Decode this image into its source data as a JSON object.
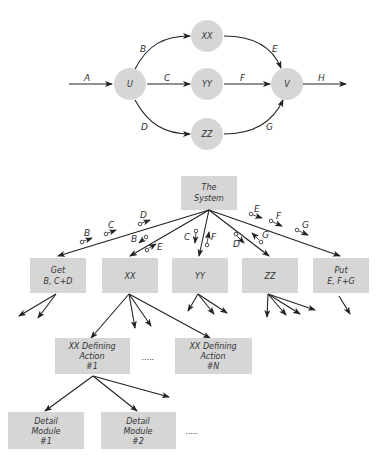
{
  "flow_diagram": {
    "nodes": [
      {
        "id": "U",
        "label": "U"
      },
      {
        "id": "XX",
        "label": "XX"
      },
      {
        "id": "YY",
        "label": "YY"
      },
      {
        "id": "ZZ",
        "label": "ZZ"
      },
      {
        "id": "V",
        "label": "V"
      }
    ],
    "edges": [
      {
        "from": "in",
        "to": "U",
        "label": "A"
      },
      {
        "from": "U",
        "to": "XX",
        "label": "B"
      },
      {
        "from": "U",
        "to": "YY",
        "label": "C"
      },
      {
        "from": "U",
        "to": "ZZ",
        "label": "D"
      },
      {
        "from": "XX",
        "to": "V",
        "label": "E"
      },
      {
        "from": "YY",
        "to": "V",
        "label": "F"
      },
      {
        "from": "ZZ",
        "to": "V",
        "label": "G"
      },
      {
        "from": "V",
        "to": "out",
        "label": "H"
      }
    ]
  },
  "structure_chart": {
    "root": {
      "line1": "The",
      "line2": "System"
    },
    "level1": [
      {
        "line1": "Get",
        "line2": "B, C+D"
      },
      {
        "line1": "XX",
        "line2": ""
      },
      {
        "line1": "YY",
        "line2": ""
      },
      {
        "line1": "ZZ",
        "line2": ""
      },
      {
        "line1": "Put",
        "line2": "E, F+G"
      }
    ],
    "couples": {
      "get": [
        "B",
        "C",
        "D"
      ],
      "xx": [
        "B",
        "E"
      ],
      "yy": [
        "C",
        "F"
      ],
      "zz": [
        "D",
        "G"
      ],
      "put": [
        "E",
        "F",
        "G"
      ]
    },
    "level2": [
      {
        "line1": "XX Defining",
        "line2": "Action",
        "line3": "#1"
      },
      {
        "line1": "XX Defining",
        "line2": "Action",
        "line3": "#N"
      }
    ],
    "level3": [
      {
        "line1": "Detail",
        "line2": "Module",
        "line3": "#1"
      },
      {
        "line1": "Detail",
        "line2": "Module",
        "line3": "#2"
      }
    ],
    "ellipsis": "....."
  }
}
